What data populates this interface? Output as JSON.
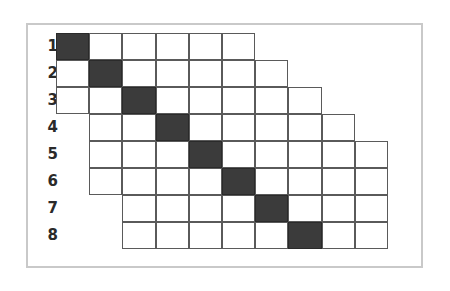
{
  "figure": {
    "title": "",
    "type": "staircase-band-matrix-diagram",
    "background_color": "#ffffff",
    "frame_border_color": "#c9c9c9",
    "grid_line_color": "#5a5a5a",
    "filled_cell_color": "#3b3b3b",
    "empty_cell_color": "#ffffff",
    "label_color": "#2a2a2a"
  },
  "geometry": {
    "origin_x": 56,
    "origin_y": 33,
    "cell_width": 33.2,
    "cell_height": 27.0,
    "label_x": 38,
    "label_offset_y": 6
  },
  "chart_data": {
    "type": "heatmap",
    "title": "",
    "xlabel": "",
    "ylabel": "",
    "row_labels": [
      "1",
      "2",
      "3",
      "4",
      "5",
      "6",
      "7",
      "8"
    ],
    "n_rows": 8,
    "rows": [
      {
        "label": "1",
        "start_col": 0,
        "cell_count": 6,
        "filled_col": 0
      },
      {
        "label": "2",
        "start_col": 0,
        "cell_count": 7,
        "filled_col": 1
      },
      {
        "label": "3",
        "start_col": 0,
        "cell_count": 8,
        "filled_col": 2
      },
      {
        "label": "4",
        "start_col": 1,
        "cell_count": 8,
        "filled_col": 3
      },
      {
        "label": "5",
        "start_col": 1,
        "cell_count": 9,
        "filled_col": 4
      },
      {
        "label": "6",
        "start_col": 1,
        "cell_count": 9,
        "filled_col": 5
      },
      {
        "label": "7",
        "start_col": 2,
        "cell_count": 8,
        "filled_col": 6
      },
      {
        "label": "8",
        "start_col": 2,
        "cell_count": 8,
        "filled_col": 7
      }
    ]
  }
}
